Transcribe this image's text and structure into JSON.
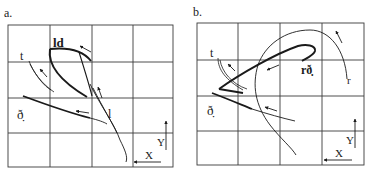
{
  "panels": [
    {
      "id": "a",
      "label": "a.",
      "traces": [
        {
          "name": "ld",
          "label": "ld"
        },
        {
          "name": "t",
          "label": "t"
        },
        {
          "name": "dh",
          "label": "ð̣"
        },
        {
          "name": "l",
          "label": "l"
        }
      ],
      "axes": {
        "x_label": "X",
        "y_label": "Y"
      }
    },
    {
      "id": "b",
      "label": "b.",
      "traces": [
        {
          "name": "rdh",
          "label": "rð̣"
        },
        {
          "name": "t",
          "label": "t"
        },
        {
          "name": "dh",
          "label": "ð̣"
        },
        {
          "name": "r",
          "label": "r"
        }
      ],
      "axes": {
        "x_label": "X",
        "y_label": "Y"
      }
    }
  ],
  "colors": {
    "ink": "#1a1a1a",
    "grid": "#3a3a3a",
    "background": "#ffffff"
  }
}
